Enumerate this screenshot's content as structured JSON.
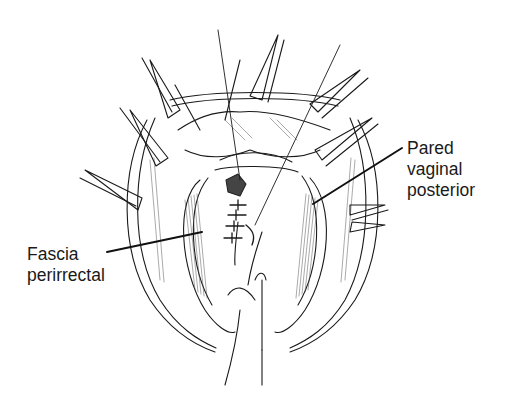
{
  "figure": {
    "background": "#ffffff",
    "ink_color": "#1a1a1a"
  },
  "labels": {
    "right": {
      "lines": [
        "Pared",
        "vaginal",
        "posterior"
      ]
    },
    "left": {
      "lines": [
        "Fascia",
        "perirrectal"
      ]
    }
  },
  "leaders": {
    "right": {
      "from": [
        402,
        148
      ],
      "to": [
        313,
        204
      ]
    },
    "left": {
      "from": [
        107,
        252
      ],
      "to": [
        202,
        232
      ]
    }
  }
}
